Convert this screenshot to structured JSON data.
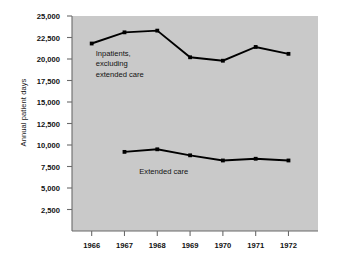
{
  "chart_data": {
    "type": "line",
    "title": "",
    "xlabel": "",
    "ylabel": "Annual patient days",
    "x": [
      1966,
      1967,
      1968,
      1969,
      1970,
      1971,
      1972
    ],
    "xtick_labels": [
      "1966",
      "1967",
      "1968",
      "1969",
      "1970",
      "1971",
      "1972"
    ],
    "ytick_labels": [
      "2,500",
      "5,000",
      "7,500",
      "10,000",
      "12,500",
      "15,000",
      "17,500",
      "20,000",
      "22,500",
      "25,000"
    ],
    "yticks": [
      2500,
      5000,
      7500,
      10000,
      12500,
      15000,
      17500,
      20000,
      22500,
      25000
    ],
    "ylim": [
      0,
      25000
    ],
    "xlim": [
      1965.4,
      1972.9
    ],
    "grid": false,
    "legend_position": "inline-annotation",
    "series": [
      {
        "name": "Inpatients, excluding extended care",
        "label_lines": [
          "Inpatients,",
          "excluding",
          "extended care"
        ],
        "x": [
          1966,
          1967,
          1968,
          1969,
          1970,
          1971,
          1972
        ],
        "values": [
          21800,
          23100,
          23300,
          20200,
          19800,
          21400,
          20600
        ],
        "color": "#000000"
      },
      {
        "name": "Extended care",
        "label_lines": [
          "Extended care"
        ],
        "x": [
          1967,
          1968,
          1969,
          1970,
          1971,
          1972
        ],
        "values": [
          9200,
          9500,
          8800,
          8200,
          8400,
          8200
        ],
        "color": "#000000"
      }
    ],
    "plot_background": "#c9c9c9",
    "axis_color": "#6b6b6b",
    "figure_background": "#ffffff"
  }
}
